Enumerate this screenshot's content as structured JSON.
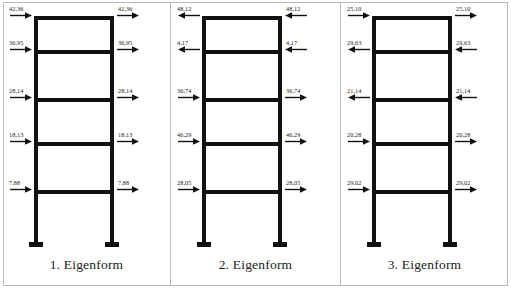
{
  "figure": {
    "type": "structural-mode-shape-diagram",
    "panel_count": 3,
    "storeys": 5,
    "line_color": "#111111",
    "border_color": "#b9b9b9"
  },
  "panels": [
    {
      "id": "panel-1",
      "caption": "1. Eigenform",
      "nodes": [
        {
          "storey": 5,
          "value": "42,36",
          "direction": "right"
        },
        {
          "storey": 4,
          "value": "36,95",
          "direction": "right"
        },
        {
          "storey": 3,
          "value": "28,14",
          "direction": "right"
        },
        {
          "storey": 2,
          "value": "18,13",
          "direction": "right"
        },
        {
          "storey": 1,
          "value": "7,88",
          "direction": "right"
        }
      ]
    },
    {
      "id": "panel-2",
      "caption": "2. Eigenform",
      "nodes": [
        {
          "storey": 5,
          "value": "48,12",
          "direction": "left"
        },
        {
          "storey": 4,
          "value": "4,17",
          "direction": "left"
        },
        {
          "storey": 3,
          "value": "36,74",
          "direction": "right"
        },
        {
          "storey": 2,
          "value": "46,29",
          "direction": "right"
        },
        {
          "storey": 1,
          "value": "28,05",
          "direction": "right"
        }
      ]
    },
    {
      "id": "panel-3",
      "caption": "3. Eigenform",
      "nodes": [
        {
          "storey": 5,
          "value": "25,10",
          "direction": "right"
        },
        {
          "storey": 4,
          "value": "29,63",
          "direction": "left"
        },
        {
          "storey": 3,
          "value": "21,14",
          "direction": "left"
        },
        {
          "storey": 2,
          "value": "20,28",
          "direction": "right"
        },
        {
          "storey": 1,
          "value": "29,02",
          "direction": "right"
        }
      ]
    }
  ],
  "chart_data": {
    "type": "table",
    "categories": [
      "5",
      "4",
      "3",
      "2",
      "1"
    ],
    "xlabel": "Eigenform",
    "ylabel": "Geschoss",
    "series": [
      {
        "name": "1. Eigenform",
        "values": [
          "42,36",
          "36,95",
          "28,14",
          "18,13",
          "7,88"
        ],
        "directions": [
          "right",
          "right",
          "right",
          "right",
          "right"
        ]
      },
      {
        "name": "2. Eigenform",
        "values": [
          "48,12",
          "4,17",
          "36,74",
          "46,29",
          "28,05"
        ],
        "directions": [
          "left",
          "left",
          "right",
          "right",
          "right"
        ]
      },
      {
        "name": "3. Eigenform",
        "values": [
          "25,10",
          "29,63",
          "21,14",
          "20,28",
          "29,02"
        ],
        "directions": [
          "right",
          "left",
          "left",
          "right",
          "right"
        ]
      }
    ],
    "grid": false,
    "legend": "bottom"
  }
}
